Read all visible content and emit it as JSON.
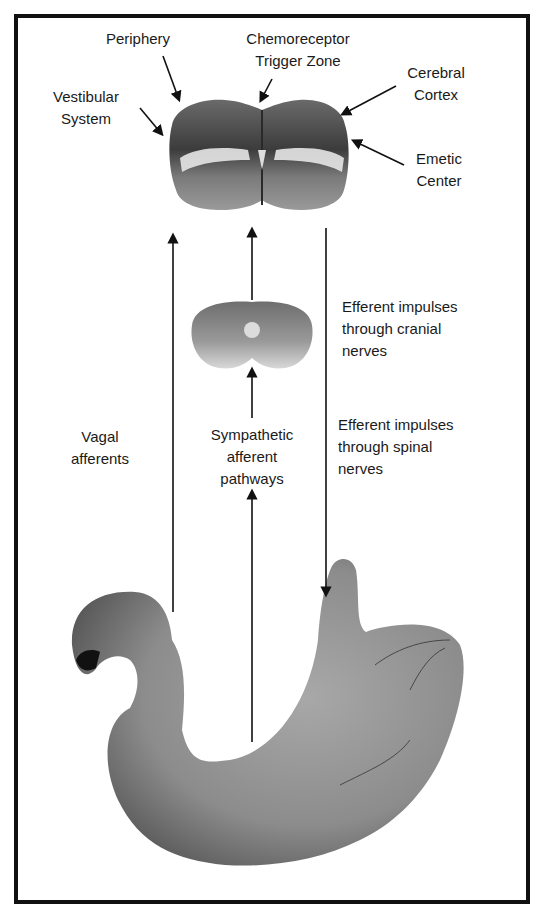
{
  "figure": {
    "brainstem_labels": {
      "periphery": "Periphery",
      "ctz": "Chemoreceptor\nTrigger Zone",
      "vestibular": "Vestibular\nSystem",
      "cortex": "Cerebral\nCortex",
      "emetic": "Emetic\nCenter"
    },
    "pathway_labels": {
      "vagal": "Vagal\nafferents",
      "sympathetic": "Sympathetic\nafferent\npathways",
      "efferent_cranial": "Efferent impulses\nthrough cranial\nnerves",
      "efferent_spinal": "Efferent impulses\nthrough spinal\nnerves"
    },
    "structures": [
      "brainstem-section",
      "spinal-cord-section",
      "stomach"
    ],
    "colors": {
      "border": "#111111",
      "arrow": "#111111",
      "tissue_dark": "#4a4a4a",
      "tissue_mid": "#8a8a8a",
      "tissue_light": "#d0d0d0"
    }
  }
}
